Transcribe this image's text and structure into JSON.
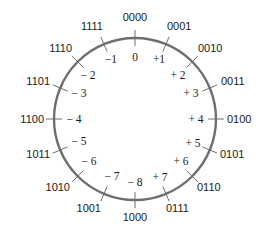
{
  "diagram": {
    "center": [
      135,
      119
    ],
    "radius": 81,
    "ring_color": "#6e6e6e",
    "text_color": "#1a1a1a",
    "positions": [
      {
        "binary": "0000",
        "decimal": "0"
      },
      {
        "binary": "0001",
        "decimal": "+1"
      },
      {
        "binary": "0010",
        "decimal": "+ 2"
      },
      {
        "binary": "0011",
        "decimal": "+ 3"
      },
      {
        "binary": "0100",
        "decimal": "+ 4"
      },
      {
        "binary": "0101",
        "decimal": "+ 5"
      },
      {
        "binary": "0110",
        "decimal": "+ 6"
      },
      {
        "binary": "0111",
        "decimal": "+ 7"
      },
      {
        "binary": "1000",
        "decimal": "− 8"
      },
      {
        "binary": "1001",
        "decimal": "− 7"
      },
      {
        "binary": "1010",
        "decimal": "− 6"
      },
      {
        "binary": "1011",
        "decimal": "− 5"
      },
      {
        "binary": "1100",
        "decimal": "− 4"
      },
      {
        "binary": "1101",
        "decimal": "− 3"
      },
      {
        "binary": "1110",
        "decimal": "− 2"
      },
      {
        "binary": "1111",
        "decimal": "−1"
      }
    ]
  }
}
